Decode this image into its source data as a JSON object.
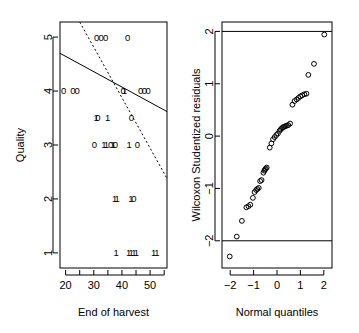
{
  "figure": {
    "panel_count": 2,
    "background": "#ffffff",
    "foreground": "#000000"
  },
  "chart_data": [
    {
      "id": "quality-vs-end-of-harvest",
      "type": "scatter",
      "title": "",
      "xlabel": "End of harvest",
      "ylabel": "Quality",
      "xlim": [
        18,
        56
      ],
      "ylim": [
        0.72,
        5.28
      ],
      "xticks": [
        20,
        30,
        40,
        50
      ],
      "xtick_labels": [
        "20",
        "30",
        "40",
        "50"
      ],
      "xminorticks": [
        25,
        35,
        45,
        55
      ],
      "yticks": [
        1,
        2,
        3,
        4,
        5
      ],
      "ytick_labels": [
        "1",
        "2",
        "3",
        "4",
        "5"
      ],
      "grid": false,
      "legend": false,
      "point_glyph_note": "plotted as text characters 0 and 1 denoting group",
      "points": [
        {
          "x": 31.0,
          "y": 5.0,
          "label": "0"
        },
        {
          "x": 32.6,
          "y": 5.0,
          "label": "0"
        },
        {
          "x": 34.2,
          "y": 5.0,
          "label": "0"
        },
        {
          "x": 42.0,
          "y": 5.0,
          "label": "0"
        },
        {
          "x": 19.3,
          "y": 4.0,
          "label": "0"
        },
        {
          "x": 22.6,
          "y": 4.0,
          "label": "0"
        },
        {
          "x": 24.1,
          "y": 4.0,
          "label": "0"
        },
        {
          "x": 40.4,
          "y": 4.0,
          "label": "0"
        },
        {
          "x": 40.9,
          "y": 4.0,
          "label": "1"
        },
        {
          "x": 46.6,
          "y": 4.0,
          "label": "0"
        },
        {
          "x": 48.0,
          "y": 4.0,
          "label": "0"
        },
        {
          "x": 49.3,
          "y": 4.0,
          "label": "0"
        },
        {
          "x": 30.8,
          "y": 3.5,
          "label": "1"
        },
        {
          "x": 31.5,
          "y": 3.5,
          "label": "0"
        },
        {
          "x": 34.9,
          "y": 3.5,
          "label": "1"
        },
        {
          "x": 43.4,
          "y": 3.5,
          "label": "0"
        },
        {
          "x": 30.2,
          "y": 3.0,
          "label": "0"
        },
        {
          "x": 33.6,
          "y": 3.0,
          "label": "1"
        },
        {
          "x": 34.5,
          "y": 3.0,
          "label": "1"
        },
        {
          "x": 36.0,
          "y": 3.0,
          "label": "0"
        },
        {
          "x": 36.9,
          "y": 3.0,
          "label": "1"
        },
        {
          "x": 37.7,
          "y": 3.0,
          "label": "0"
        },
        {
          "x": 42.6,
          "y": 3.0,
          "label": "1"
        },
        {
          "x": 45.5,
          "y": 3.0,
          "label": "0"
        },
        {
          "x": 37.4,
          "y": 2.0,
          "label": "1"
        },
        {
          "x": 38.3,
          "y": 2.0,
          "label": "1"
        },
        {
          "x": 43.2,
          "y": 2.0,
          "label": "1"
        },
        {
          "x": 44.2,
          "y": 2.0,
          "label": "0"
        },
        {
          "x": 37.9,
          "y": 1.0,
          "label": "1"
        },
        {
          "x": 42.4,
          "y": 1.0,
          "label": "1"
        },
        {
          "x": 43.3,
          "y": 1.0,
          "label": "1"
        },
        {
          "x": 44.2,
          "y": 1.0,
          "label": "1"
        },
        {
          "x": 45.1,
          "y": 1.0,
          "label": "1"
        },
        {
          "x": 51.3,
          "y": 1.0,
          "label": "1"
        },
        {
          "x": 52.4,
          "y": 1.0,
          "label": "1"
        }
      ],
      "lines": [
        {
          "name": "solid-fit",
          "style": "solid",
          "x1": 18.0,
          "y1": 4.7,
          "x2": 56.0,
          "y2": 3.62
        },
        {
          "name": "dashed-fit",
          "style": "dashed",
          "x1": 25.0,
          "y1": 5.28,
          "x2": 56.0,
          "y2": 2.38
        }
      ]
    },
    {
      "id": "normal-qq-wilcoxon-residuals",
      "type": "scatter",
      "title": "",
      "xlabel": "Normal quantiles",
      "ylabel": "Wilcoxon Studentized residuals",
      "xlim": [
        -2.35,
        2.35
      ],
      "ylim": [
        -2.52,
        2.18
      ],
      "xticks": [
        -2,
        -1,
        0,
        1,
        2
      ],
      "xtick_labels": [
        "−2",
        "−1",
        "0",
        "1",
        "2"
      ],
      "yticks": [
        -2,
        -1,
        0,
        1,
        2
      ],
      "ytick_labels": [
        "−2",
        "−1",
        "0",
        "1",
        "2"
      ],
      "grid": false,
      "legend": false,
      "reference_lines": [
        {
          "name": "upper-bound",
          "orientation": "horizontal",
          "y": 2.0
        },
        {
          "name": "lower-bound",
          "orientation": "horizontal",
          "y": -2.0
        }
      ],
      "points": [
        {
          "x": -2.02,
          "y": -2.3
        },
        {
          "x": -1.72,
          "y": -1.92
        },
        {
          "x": -1.5,
          "y": -1.62
        },
        {
          "x": -1.31,
          "y": -1.36
        },
        {
          "x": -1.22,
          "y": -1.34
        },
        {
          "x": -1.14,
          "y": -1.31
        },
        {
          "x": -1.03,
          "y": -1.18
        },
        {
          "x": -0.96,
          "y": -1.07
        },
        {
          "x": -0.89,
          "y": -1.03
        },
        {
          "x": -0.84,
          "y": -1.01
        },
        {
          "x": -0.78,
          "y": -0.99
        },
        {
          "x": -0.72,
          "y": -0.86
        },
        {
          "x": -0.66,
          "y": -0.84
        },
        {
          "x": -0.58,
          "y": -0.7
        },
        {
          "x": -0.54,
          "y": -0.66
        },
        {
          "x": -0.51,
          "y": -0.64
        },
        {
          "x": -0.48,
          "y": -0.62
        },
        {
          "x": -0.44,
          "y": -0.6
        },
        {
          "x": -0.31,
          "y": -0.22
        },
        {
          "x": -0.24,
          "y": -0.14
        },
        {
          "x": -0.17,
          "y": -0.06
        },
        {
          "x": -0.1,
          "y": -0.02
        },
        {
          "x": -0.03,
          "y": 0.02
        },
        {
          "x": 0.04,
          "y": 0.05
        },
        {
          "x": 0.11,
          "y": 0.1
        },
        {
          "x": 0.16,
          "y": 0.13
        },
        {
          "x": 0.21,
          "y": 0.15
        },
        {
          "x": 0.26,
          "y": 0.17
        },
        {
          "x": 0.31,
          "y": 0.18
        },
        {
          "x": 0.36,
          "y": 0.19
        },
        {
          "x": 0.42,
          "y": 0.2
        },
        {
          "x": 0.48,
          "y": 0.21
        },
        {
          "x": 0.56,
          "y": 0.24
        },
        {
          "x": 0.66,
          "y": 0.6
        },
        {
          "x": 0.75,
          "y": 0.67
        },
        {
          "x": 0.84,
          "y": 0.7
        },
        {
          "x": 0.92,
          "y": 0.73
        },
        {
          "x": 1.0,
          "y": 0.76
        },
        {
          "x": 1.08,
          "y": 0.78
        },
        {
          "x": 1.17,
          "y": 0.8
        },
        {
          "x": 1.26,
          "y": 0.81
        },
        {
          "x": 1.34,
          "y": 1.17
        },
        {
          "x": 1.58,
          "y": 1.38
        },
        {
          "x": 2.02,
          "y": 1.94
        }
      ]
    }
  ]
}
